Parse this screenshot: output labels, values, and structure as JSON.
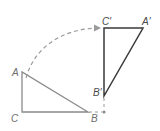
{
  "diagram": {
    "colors": {
      "original": "#8a8a8a",
      "image": "#3a3a3a",
      "arc": "#9a9a9a"
    },
    "original_triangle": {
      "vertices": {
        "A": "A",
        "B": "B",
        "C": "C"
      }
    },
    "image_triangle": {
      "vertices": {
        "A": "A′",
        "B": "B′",
        "C": "C′"
      }
    },
    "rotation": {
      "direction": "clockwise",
      "angle_degrees": 90,
      "center_label": ""
    }
  }
}
